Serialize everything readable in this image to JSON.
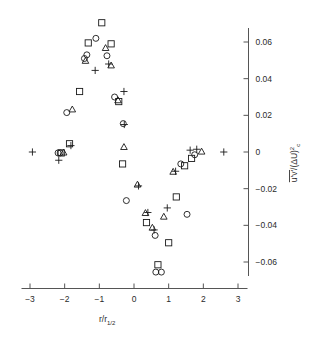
{
  "figure": {
    "title": "",
    "background_color": "#ffffff",
    "marker_color": "#1a1a1a",
    "axis_color": "#555555"
  },
  "chart_data": {
    "type": "scatter",
    "title": "",
    "subtitle": "",
    "xlabel": "r/r_1/2",
    "xlabel_parts": {
      "main": "r/r",
      "sub": "1/2"
    },
    "ylabel": "u'v'/(ΔU)²c",
    "ylabel_parts": {
      "overline": "u'v'",
      "slash": "/(ΔU)",
      "sup": "2",
      "sub": "c"
    },
    "xlim": [
      -3.4,
      3.4
    ],
    "ylim": [
      -0.075,
      0.072
    ],
    "xticks": [
      -3,
      -2,
      -1,
      0,
      1,
      2,
      3
    ],
    "xticklabels": [
      "−3",
      "−2",
      "−1",
      "0",
      "1",
      "2",
      "3"
    ],
    "yticks": [
      0.06,
      0.04,
      0.02,
      0,
      -0.02,
      -0.04,
      -0.06
    ],
    "yticklabels": [
      "0.06",
      "0.04",
      "0.02",
      "0",
      "−0.02",
      "−0.04",
      "−0.06"
    ],
    "grid": false,
    "legend": false,
    "axis_style": "left-x-bottom right-y",
    "series": [
      {
        "name": "square",
        "marker": "square",
        "points": [
          [
            -0.93,
            0.0705
          ],
          [
            -1.32,
            0.0595
          ],
          [
            -0.66,
            0.059
          ],
          [
            -1.57,
            0.033
          ],
          [
            -1.86,
            0.0045
          ],
          [
            -2.1,
            -0.0005
          ],
          [
            -0.44,
            0.0275
          ],
          [
            -0.33,
            -0.0065
          ],
          [
            0.36,
            -0.0385
          ],
          [
            0.69,
            -0.0615
          ],
          [
            1.0,
            -0.0495
          ],
          [
            1.22,
            -0.0245
          ],
          [
            1.46,
            -0.0075
          ],
          [
            1.66,
            -0.0035
          ]
        ]
      },
      {
        "name": "circle",
        "marker": "circle",
        "points": [
          [
            -1.1,
            0.062
          ],
          [
            -1.36,
            0.053
          ],
          [
            -1.43,
            0.051
          ],
          [
            -0.78,
            0.0525
          ],
          [
            -1.94,
            0.0215
          ],
          [
            -2.19,
            -0.0005
          ],
          [
            -2.13,
            -0.0005
          ],
          [
            -0.56,
            0.03
          ],
          [
            -0.31,
            0.0155
          ],
          [
            -0.22,
            -0.0265
          ],
          [
            1.53,
            -0.034
          ],
          [
            1.35,
            -0.0065
          ],
          [
            1.75,
            -0.0015
          ],
          [
            0.61,
            -0.0455
          ],
          [
            0.63,
            -0.0655
          ],
          [
            0.79,
            -0.0655
          ]
        ]
      },
      {
        "name": "triangle",
        "marker": "triangle",
        "points": [
          [
            -0.82,
            0.0565
          ],
          [
            -1.4,
            0.0495
          ],
          [
            -0.66,
            0.047
          ],
          [
            -1.78,
            0.023
          ],
          [
            -2.03,
            -0.0005
          ],
          [
            -0.46,
            0.028
          ],
          [
            -0.29,
            0.0025
          ],
          [
            0.1,
            -0.018
          ],
          [
            0.33,
            -0.0335
          ],
          [
            0.53,
            -0.0415
          ],
          [
            0.86,
            -0.0355
          ],
          [
            1.13,
            -0.011
          ],
          [
            1.95,
            0.0
          ]
        ]
      },
      {
        "name": "plus",
        "marker": "plus",
        "points": [
          [
            -1.12,
            0.0445
          ],
          [
            -0.73,
            0.048
          ],
          [
            -1.82,
            0.0035
          ],
          [
            -2.17,
            -0.0045
          ],
          [
            -2.93,
            0.0
          ],
          [
            -0.29,
            0.033
          ],
          [
            -0.28,
            0.015
          ],
          [
            0.13,
            -0.0185
          ],
          [
            0.4,
            -0.033
          ],
          [
            0.58,
            -0.0425
          ],
          [
            0.96,
            -0.0305
          ],
          [
            1.2,
            -0.0105
          ],
          [
            1.62,
            0.001
          ],
          [
            1.81,
            0.0015
          ],
          [
            2.59,
            0.0
          ]
        ]
      }
    ]
  }
}
